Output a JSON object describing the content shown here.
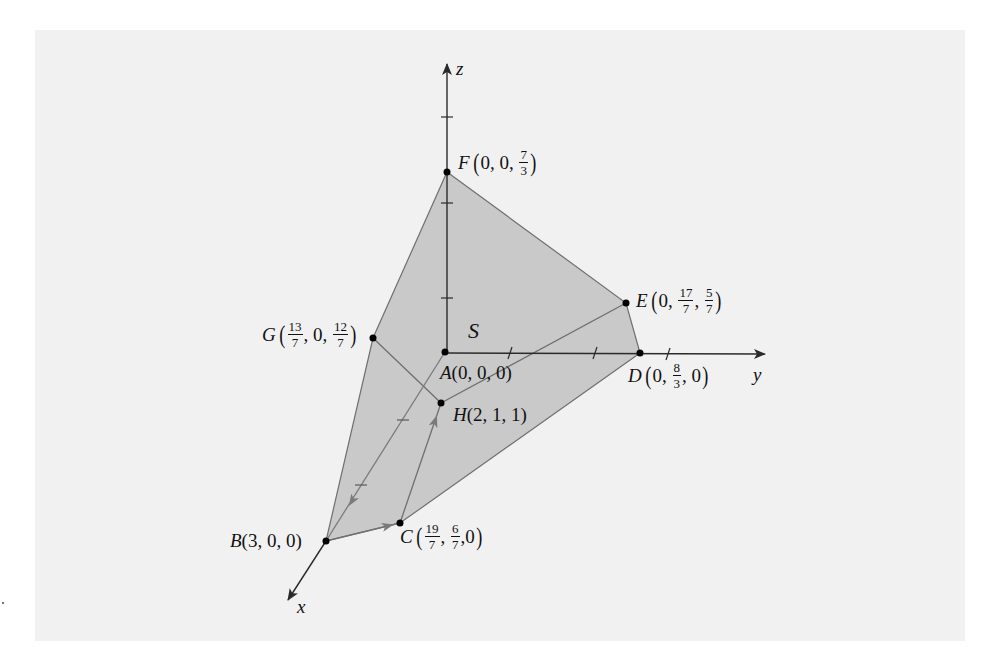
{
  "figure": {
    "type": "3d-feasible-region",
    "colors": {
      "background": "#ffffff",
      "panel": "#f1f1f1",
      "region_fill": "#c9c9c9",
      "axis": "#2a2a2a",
      "edge": "#6f6f6f",
      "point": "#000000"
    },
    "axes": {
      "x": {
        "label": "x"
      },
      "y": {
        "label": "y"
      },
      "z": {
        "label": "z"
      }
    },
    "region_label": "S",
    "points": {
      "A": {
        "name": "A",
        "coords": "(0, 0, 0)"
      },
      "B": {
        "name": "B",
        "coords": "(3, 0, 0)"
      },
      "C": {
        "name": "C",
        "parts": [
          {
            "num": "19",
            "den": "7"
          },
          {
            "num": "6",
            "den": "7"
          },
          {
            "text": "0"
          }
        ]
      },
      "D": {
        "name": "D",
        "parts": [
          {
            "text": "0"
          },
          {
            "num": "8",
            "den": "3"
          },
          {
            "text": "0"
          }
        ]
      },
      "E": {
        "name": "E",
        "parts": [
          {
            "text": "0"
          },
          {
            "num": "17",
            "den": "7"
          },
          {
            "num": "5",
            "den": "7"
          }
        ]
      },
      "F": {
        "name": "F",
        "parts": [
          {
            "text": "0"
          },
          {
            "text": "0"
          },
          {
            "num": "7",
            "den": "3"
          }
        ]
      },
      "G": {
        "name": "G",
        "parts": [
          {
            "num": "13",
            "den": "7"
          },
          {
            "text": "0"
          },
          {
            "num": "12",
            "den": "7"
          }
        ]
      },
      "H": {
        "name": "H",
        "coords": "(2, 1, 1)"
      }
    },
    "path": [
      "A",
      "B",
      "C",
      "H"
    ],
    "comma": ","
  }
}
